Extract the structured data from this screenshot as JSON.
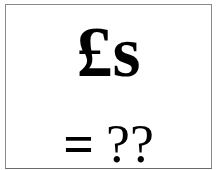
{
  "sign": {
    "line1": "£s",
    "line2_equals": "=",
    "line2_value": "??"
  },
  "colors": {
    "text": "#000000",
    "background": "#ffffff",
    "border": "#8a8a8a"
  }
}
